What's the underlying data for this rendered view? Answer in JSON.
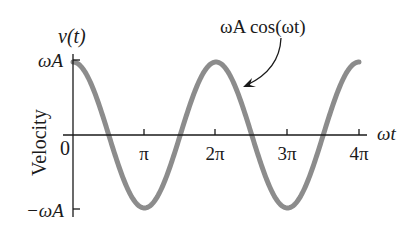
{
  "chart_data": {
    "type": "line",
    "title": "",
    "annotation": "ωA cos(ωt)",
    "xlabel": "ωt",
    "ylabel": "Velocity",
    "y_axis_symbol": "v(t)",
    "x_ticks": [
      "0",
      "π",
      "2π",
      "3π",
      "4π"
    ],
    "x_tick_values": [
      0,
      3.14159,
      6.28319,
      9.42478,
      12.56637
    ],
    "y_ticks": [
      "ωA",
      "−ωA"
    ],
    "y_tick_values": [
      1,
      -1
    ],
    "xlim": [
      0,
      12.8
    ],
    "ylim": [
      -1,
      1
    ],
    "grid": false,
    "legend": "none",
    "series": [
      {
        "name": "ωA cos(ωt)",
        "color": "#8c8c8c",
        "x": [
          0,
          1.5708,
          3.14159,
          4.71239,
          6.28319,
          7.85398,
          9.42478,
          10.99557,
          12.56637
        ],
        "values": [
          1,
          0,
          -1,
          0,
          1,
          0,
          -1,
          0,
          1
        ]
      }
    ]
  },
  "labels": {
    "y_symbol": "v(t)",
    "y_axis_title": "Velocity",
    "y_max": "ωA",
    "y_min": "−ωA",
    "zero": "0",
    "x_axis_title": "ωt",
    "tick_pi": "π",
    "tick_2pi": "2π",
    "tick_3pi": "3π",
    "tick_4pi": "4π",
    "curve_label": "ωA cos(ωt)"
  },
  "colors": {
    "curve": "#8c8c8c",
    "axis": "#1a1a1a"
  }
}
